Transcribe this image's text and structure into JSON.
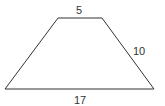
{
  "diagram": {
    "shape": "trapezoid",
    "stroke_color": "#333333",
    "vertices": {
      "top_left": [
        58,
        18
      ],
      "top_right": [
        102,
        18
      ],
      "bottom_right": [
        154,
        89
      ],
      "bottom_left": [
        5,
        89
      ]
    },
    "labels": {
      "top": "5",
      "right": "10",
      "bottom": "17"
    }
  }
}
